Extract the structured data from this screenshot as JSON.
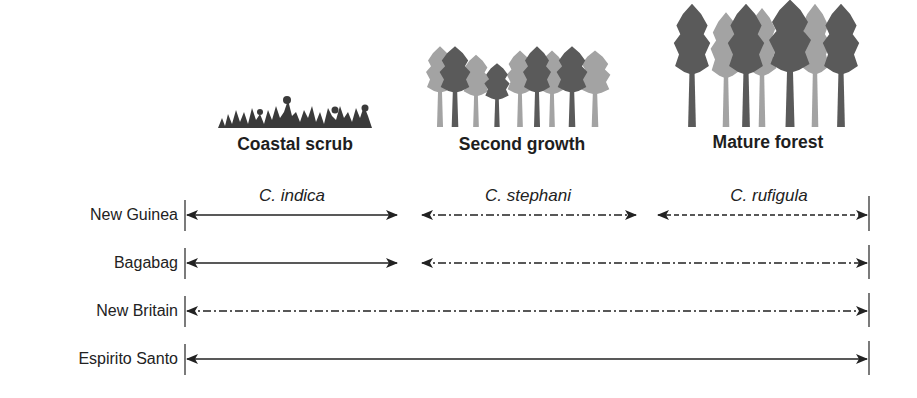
{
  "habitats": [
    {
      "label": "Coastal scrub",
      "icon": "scrub-icon"
    },
    {
      "label": "Second growth",
      "icon": "second-growth-forest-icon"
    },
    {
      "label": "Mature forest",
      "icon": "mature-forest-icon"
    }
  ],
  "species": [
    {
      "label": "C. indica",
      "line_style": "solid"
    },
    {
      "label": "C. stephani",
      "line_style": "dash-dot"
    },
    {
      "label": "C. rufigula",
      "line_style": "dashed"
    }
  ],
  "islands": [
    {
      "label": "New Guinea",
      "ranges": [
        {
          "species": "C. indica",
          "from": "coastal scrub",
          "to": "coastal scrub",
          "style": "solid"
        },
        {
          "species": "C. stephani",
          "from": "second growth",
          "to": "second growth",
          "style": "dash-dot"
        },
        {
          "species": "C. rufigula",
          "from": "mature forest",
          "to": "mature forest",
          "style": "dashed"
        }
      ]
    },
    {
      "label": "Bagabag",
      "ranges": [
        {
          "species": "C. indica",
          "from": "coastal scrub",
          "to": "coastal scrub",
          "style": "solid"
        },
        {
          "species": "C. stephani",
          "from": "second growth",
          "to": "mature forest",
          "style": "dash-dot"
        }
      ]
    },
    {
      "label": "New Britain",
      "ranges": [
        {
          "species": "C. stephani",
          "from": "coastal scrub",
          "to": "mature forest",
          "style": "dash-dot"
        }
      ]
    },
    {
      "label": "Espirito Santo",
      "ranges": [
        {
          "species": "C. indica",
          "from": "coastal scrub",
          "to": "mature forest",
          "style": "solid"
        }
      ]
    }
  ],
  "colors": {
    "line": "#222222",
    "tree_dark": "#5a5a5a",
    "tree_light": "#a3a3a3",
    "text": "#222222"
  }
}
